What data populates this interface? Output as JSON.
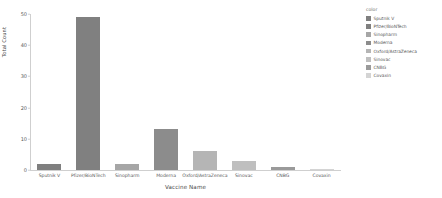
{
  "chart_data": {
    "type": "bar",
    "title": "",
    "xlabel": "Vaccine Name",
    "ylabel": "Total Count",
    "categories": [
      "Sputnik V",
      "Pfizer/BioNTech",
      "Sinopharm",
      "Moderna",
      "Oxford/AstraZeneca",
      "Sinovac",
      "CNBG",
      "Covaxin"
    ],
    "values": [
      2,
      49,
      2,
      13,
      6,
      3,
      1,
      0.3
    ],
    "colors": [
      "#7f7f7f",
      "#808080",
      "#a6a6a6",
      "#8c8c8c",
      "#b5b5b5",
      "#bfbfbf",
      "#9a9a9a",
      "#d4d4d4"
    ],
    "ylim": [
      0,
      50
    ],
    "yticks": [
      0,
      10,
      20,
      30,
      40,
      50
    ],
    "ytick_labels": [
      "0",
      "10",
      "20",
      "30",
      "40",
      "50"
    ],
    "grid": false,
    "legend_position": "right"
  },
  "legend": {
    "title": "color",
    "entries": [
      {
        "label": "Sputnik V",
        "color": "#7f7f7f"
      },
      {
        "label": "Pfizer/BioNTech",
        "color": "#808080"
      },
      {
        "label": "Sinopharm",
        "color": "#a6a6a6"
      },
      {
        "label": "Moderna",
        "color": "#8c8c8c"
      },
      {
        "label": "Oxford/AstraZeneca",
        "color": "#b5b5b5"
      },
      {
        "label": "Sinovac",
        "color": "#bfbfbf"
      },
      {
        "label": "CNBG",
        "color": "#9a9a9a"
      },
      {
        "label": "Covaxin",
        "color": "#d4d4d4"
      }
    ]
  }
}
